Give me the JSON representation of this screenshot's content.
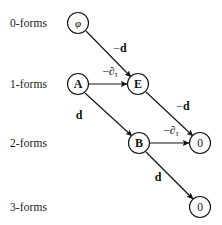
{
  "diagram": {
    "stroke_color": "#141414",
    "background_color": "#ffffff",
    "row_labels": [
      {
        "text": "0-forms",
        "x": 10,
        "y": 23
      },
      {
        "text": "1-forms",
        "x": 10,
        "y": 84
      },
      {
        "text": "2-forms",
        "x": 10,
        "y": 143
      },
      {
        "text": "3-forms",
        "x": 10,
        "y": 207
      }
    ],
    "nodes": [
      {
        "id": "phi",
        "label": "φ",
        "style": "ital",
        "x": 78,
        "y": 23,
        "r": 10.5
      },
      {
        "id": "A",
        "label": "A",
        "style": "bold",
        "x": 78,
        "y": 84,
        "r": 10.5
      },
      {
        "id": "E",
        "label": "E",
        "style": "bold",
        "x": 138,
        "y": 84,
        "r": 10.5
      },
      {
        "id": "B",
        "label": "B",
        "style": "bold",
        "x": 139,
        "y": 143,
        "r": 10.5
      },
      {
        "id": "zero2",
        "label": "0",
        "style": "plain",
        "x": 200,
        "y": 143,
        "r": 10.5
      },
      {
        "id": "zero3",
        "label": "0",
        "style": "plain",
        "x": 200,
        "y": 207,
        "r": 10.5
      }
    ],
    "edges": [
      {
        "id": "phi-E",
        "from": "phi",
        "to": "E",
        "x1": 86,
        "y1": 31,
        "x2": 131,
        "y2": 77
      },
      {
        "id": "A-E",
        "from": "A",
        "to": "E",
        "x1": 89,
        "y1": 84,
        "x2": 127,
        "y2": 84
      },
      {
        "id": "A-B",
        "from": "A",
        "to": "B",
        "x1": 85,
        "y1": 93,
        "x2": 132,
        "y2": 136
      },
      {
        "id": "E-zero2",
        "from": "E",
        "to": "zero2",
        "x1": 146,
        "y1": 92,
        "x2": 193,
        "y2": 136
      },
      {
        "id": "B-zero2",
        "from": "B",
        "to": "zero2",
        "x1": 150,
        "y1": 143,
        "x2": 189,
        "y2": 143
      },
      {
        "id": "B-zero3",
        "from": "B",
        "to": "zero3",
        "x1": 146,
        "y1": 152,
        "x2": 193,
        "y2": 199
      }
    ],
    "edge_labels": [
      {
        "id": "label-phi-E",
        "kind": "d",
        "minus": "−",
        "symbol": "d",
        "x": 120,
        "y": 48
      },
      {
        "id": "label-A-E",
        "kind": "dtau",
        "minus": "−",
        "symbol": "∂",
        "subscript": "τ",
        "x": 110,
        "y": 72
      },
      {
        "id": "label-A-B",
        "kind": "d",
        "minus": "",
        "symbol": "d",
        "x": 79,
        "y": 115
      },
      {
        "id": "label-E-zero2",
        "kind": "d",
        "minus": "−",
        "symbol": "d",
        "x": 183,
        "y": 106
      },
      {
        "id": "label-B-zero2",
        "kind": "dtau",
        "minus": "−",
        "symbol": "∂",
        "subscript": "τ",
        "x": 171,
        "y": 131
      },
      {
        "id": "label-B-zero3",
        "kind": "d",
        "minus": "",
        "symbol": "d",
        "x": 158,
        "y": 177
      }
    ]
  }
}
